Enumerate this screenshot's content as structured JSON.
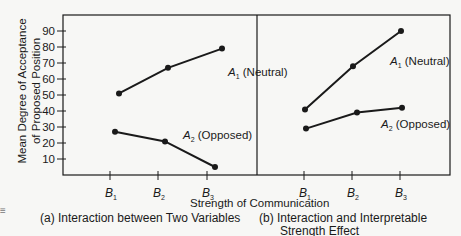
{
  "chart_data": [
    {
      "type": "line",
      "title": "(a) Interaction between Two Variables",
      "xlabel": "Strength of Communication",
      "ylabel": "Mean Degree of Acceptance of Proposed Position",
      "categories": [
        "B1",
        "B2",
        "B3"
      ],
      "ylim": [
        0,
        95
      ],
      "yticks": [
        10,
        20,
        30,
        40,
        50,
        60,
        70,
        80,
        90
      ],
      "grid": false,
      "series": [
        {
          "name": "A1 (Neutral)",
          "values": [
            51,
            67,
            79
          ]
        },
        {
          "name": "A2 (Opposed)",
          "values": [
            27,
            21,
            5
          ]
        }
      ]
    },
    {
      "type": "line",
      "title": "(b) Interaction and Interpretable Strength Effect",
      "xlabel": "Strength of Communication",
      "ylabel": "Mean Degree of Acceptance of Proposed Position",
      "categories": [
        "B1",
        "B2",
        "B3"
      ],
      "ylim": [
        0,
        95
      ],
      "grid": false,
      "series": [
        {
          "name": "A1 (Neutral)",
          "values": [
            41,
            68,
            90
          ]
        },
        {
          "name": "A2 (Opposed)",
          "values": [
            29,
            39,
            42
          ]
        }
      ]
    }
  ],
  "labels": {
    "ylabel_line1": "Mean Degree of Acceptance",
    "ylabel_line2": "of Proposed Position",
    "xlabel": "Strength of Communication",
    "caption_a": "(a) Interaction between Two Variables",
    "caption_b_line1": "(b) Interaction and Interpretable",
    "caption_b_line2": "Strength Effect",
    "a1_left": "A₁ (Neutral)",
    "a2_left": "A₂ (Opposed)",
    "a1_right": "A₁ (Neutral)",
    "a2_right": "A₂ (Opposed)"
  }
}
